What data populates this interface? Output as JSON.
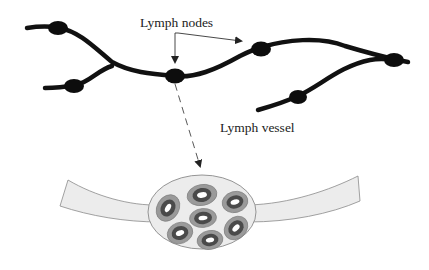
{
  "diagram": {
    "labels": {
      "nodes": "Lymph nodes",
      "vessel": "Lymph vessel"
    },
    "colors": {
      "vessel_stroke": "#111111",
      "node_fill": "#0d0d0d",
      "band_fill": "#ececec",
      "band_stroke": "#8a8a8a",
      "cell_outer": "#9a9a9a",
      "cell_ring": "#4a4a4a",
      "cell_center": "#ffffff",
      "arrow": "#333333"
    },
    "top_network": {
      "node_count": 6
    },
    "enlarged_node": {
      "cell_count": 7
    }
  }
}
